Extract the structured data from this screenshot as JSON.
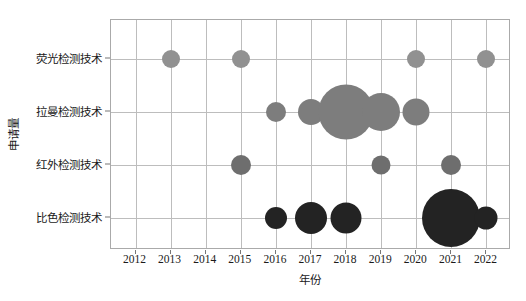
{
  "chart_data": {
    "type": "scatter",
    "title": "",
    "xlabel": "年份",
    "ylabel": "申请量",
    "grid": true,
    "legend": "none",
    "categories": [
      "荧光检测技术",
      "拉曼检测技术",
      "红外检测技术",
      "比色检测技术"
    ],
    "x": [
      2012,
      2013,
      2014,
      2015,
      2016,
      2017,
      2018,
      2019,
      2020,
      2021,
      2022
    ],
    "xlim": [
      2011.3,
      2022.7
    ],
    "series": [
      {
        "name": "荧光检测技术",
        "color": "#919191",
        "points": [
          {
            "year": 2013,
            "size": 18
          },
          {
            "year": 2015,
            "size": 18
          },
          {
            "year": 2020,
            "size": 18
          },
          {
            "year": 2022,
            "size": 18
          }
        ]
      },
      {
        "name": "拉曼检测技术",
        "color": "#7d7d7d",
        "points": [
          {
            "year": 2016,
            "size": 20
          },
          {
            "year": 2017,
            "size": 26
          },
          {
            "year": 2018,
            "size": 55
          },
          {
            "year": 2019,
            "size": 38
          },
          {
            "year": 2020,
            "size": 27
          }
        ]
      },
      {
        "name": "红外检测技术",
        "color": "#6e6e6e",
        "points": [
          {
            "year": 2015,
            "size": 20
          },
          {
            "year": 2019,
            "size": 19
          },
          {
            "year": 2021,
            "size": 20
          }
        ]
      },
      {
        "name": "比色检测技术",
        "color": "#232323",
        "points": [
          {
            "year": 2016,
            "size": 22
          },
          {
            "year": 2017,
            "size": 32
          },
          {
            "year": 2018,
            "size": 31
          },
          {
            "year": 2021,
            "size": 58
          },
          {
            "year": 2022,
            "size": 23
          }
        ]
      }
    ]
  },
  "axis": {
    "x_tick_labels": [
      "2012",
      "2013",
      "2014",
      "2015",
      "2016",
      "2017",
      "2018",
      "2019",
      "2020",
      "2021",
      "2022"
    ],
    "y_tick_labels": [
      "荧光检测技术",
      "拉曼检测技术",
      "红外检测技术",
      "比色检测技术"
    ],
    "x_title": "年份",
    "y_title": "申请量"
  }
}
